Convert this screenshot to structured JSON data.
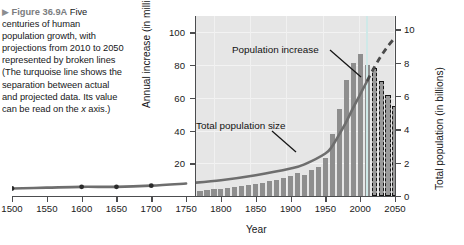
{
  "caption": {
    "triangle_icon": "▶",
    "figure_label": "Figure 36.9A",
    "text": "Five centuries of human population growth, with projections from 2010 to 2050 represented by broken lines (The turquoise line shows the separation between actual and projected data. Its value can be read on the ",
    "italic_word": "x",
    "text_tail": " axis.)"
  },
  "annotations": {
    "population_increase": "Population increase",
    "total_population_size": "Total population size"
  },
  "colors": {
    "bar": "#8e8e8e",
    "curve": "#6e6e6e",
    "separation_line": "#cfe9e8",
    "panel_background": "#e6e6e6",
    "figure_label": "#7b7d80"
  },
  "chart_data": {
    "type": "bar",
    "title": "Five centuries of human population growth",
    "xlabel": "Year",
    "ylabel": "Annual increase (in millions)",
    "y2label": "Total population (in billions)",
    "xlim": [
      1500,
      2050
    ],
    "ylim": [
      0,
      110
    ],
    "y2lim": [
      0,
      10.8
    ],
    "grid": true,
    "legend": "none",
    "xticks": [
      1500,
      1550,
      1600,
      1650,
      1700,
      1750,
      1800,
      1850,
      1900,
      1950,
      2000,
      2050
    ],
    "yticks": [
      20,
      40,
      60,
      80,
      100
    ],
    "y2ticks": [
      0,
      2,
      4,
      6,
      8,
      10
    ],
    "panel_x_start": 1750,
    "projection_start_year": 2010,
    "separation_line_year": 2010,
    "series": [
      {
        "name": "Annual increase (in millions)",
        "type": "bar",
        "axis": "left",
        "x": [
          1750,
          1760,
          1770,
          1780,
          1790,
          1800,
          1810,
          1820,
          1830,
          1840,
          1850,
          1860,
          1870,
          1880,
          1890,
          1900,
          1910,
          1920,
          1930,
          1940,
          1950,
          1960,
          1970,
          1980,
          1990,
          2000,
          2010,
          2020,
          2030,
          2040,
          2050
        ],
        "values": [
          2,
          2.5,
          3,
          3.5,
          4,
          4.5,
          5,
          5.5,
          6,
          7,
          7.5,
          8,
          9,
          10,
          11,
          12,
          14,
          13,
          16,
          18,
          23,
          38,
          53,
          71,
          81,
          87,
          80,
          78,
          70,
          62,
          55
        ],
        "projected_from_index": 27
      },
      {
        "name": "Total population size (in billions)",
        "type": "line",
        "axis": "right",
        "x": [
          1500,
          1550,
          1600,
          1650,
          1700,
          1750,
          1800,
          1850,
          1900,
          1920,
          1950,
          1960,
          1970,
          1980,
          1990,
          2000,
          2010,
          2020,
          2030,
          2040,
          2050
        ],
        "values": [
          0.45,
          0.5,
          0.55,
          0.55,
          0.62,
          0.75,
          0.95,
          1.25,
          1.65,
          1.9,
          2.55,
          3.0,
          3.7,
          4.45,
          5.3,
          6.1,
          6.9,
          7.7,
          8.4,
          9.0,
          9.5
        ],
        "markers_at": [
          1500,
          1600,
          1650,
          1700
        ],
        "projected_from_year": 2010
      }
    ]
  }
}
